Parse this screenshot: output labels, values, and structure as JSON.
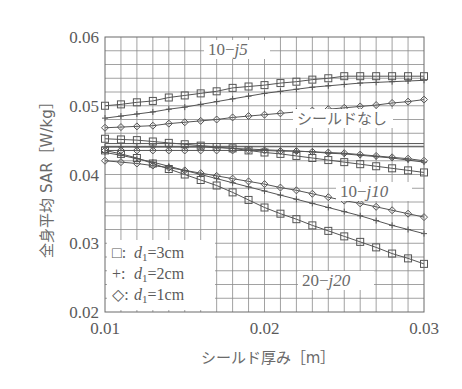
{
  "chart_data": {
    "type": "line",
    "title": "",
    "xlabel": "シールド厚み［m］",
    "ylabel": "全身平均 SAR［W/kg］",
    "xlim": [
      0.01,
      0.03
    ],
    "ylim": [
      0.02,
      0.06
    ],
    "x_ticks": [
      "0.01",
      "0.02",
      "0.03"
    ],
    "y_ticks": [
      "0.02",
      "0.03",
      "0.04",
      "0.05",
      "0.06"
    ],
    "grid": true,
    "x": [
      0.01,
      0.011,
      0.012,
      0.013,
      0.014,
      0.015,
      0.016,
      0.017,
      0.018,
      0.019,
      0.02,
      0.021,
      0.022,
      0.023,
      0.024,
      0.025,
      0.026,
      0.027,
      0.028,
      0.029,
      0.03
    ],
    "legend": [
      {
        "marker": "□",
        "label": "d1=3cm",
        "marker_name": "square"
      },
      {
        "marker": "+",
        "label": "d1=2cm",
        "marker_name": "plus"
      },
      {
        "marker": "◇",
        "label": "d1=1cm",
        "marker_name": "diamond"
      }
    ],
    "legend_position": "lower-left",
    "annotations": [
      {
        "text_main": "10",
        "text_sep": "−",
        "text_imag": "j5",
        "group": "10−j5"
      },
      {
        "text": "シールドなし",
        "group": "no-shield"
      },
      {
        "text_main": "10",
        "text_sep": "−",
        "text_imag": "j10",
        "group": "10−j10"
      },
      {
        "text_main": "20",
        "text_sep": "−",
        "text_imag": "j20",
        "group": "20−j20"
      }
    ],
    "reference_lines": [
      {
        "name": "シールドなし",
        "values": [
          0.0445,
          0.0441
        ]
      }
    ],
    "series": [
      {
        "name": "10−j5, d1=3cm",
        "marker": "square",
        "values": [
          0.05,
          0.0502,
          0.0505,
          0.0507,
          0.0512,
          0.0515,
          0.0518,
          0.0521,
          0.0526,
          0.0528,
          0.053,
          0.0533,
          0.0535,
          0.0538,
          0.054,
          0.0543,
          0.0543,
          0.0543,
          0.0543,
          0.0543,
          0.0543
        ]
      },
      {
        "name": "10−j5, d1=2cm",
        "marker": "plus",
        "values": [
          0.0482,
          0.0485,
          0.0488,
          0.0491,
          0.0495,
          0.0498,
          0.0502,
          0.0506,
          0.051,
          0.0514,
          0.0518,
          0.0521,
          0.0524,
          0.0527,
          0.0529,
          0.0531,
          0.0533,
          0.0534,
          0.0535,
          0.0536,
          0.0537
        ]
      },
      {
        "name": "10−j5, d1=1cm",
        "marker": "diamond",
        "values": [
          0.0468,
          0.0469,
          0.047,
          0.0471,
          0.0474,
          0.0476,
          0.0478,
          0.048,
          0.0483,
          0.0485,
          0.0487,
          0.0489,
          0.0491,
          0.0493,
          0.0495,
          0.0497,
          0.0499,
          0.0501,
          0.0504,
          0.0506,
          0.0509
        ]
      },
      {
        "name": "10−j10, d1=3cm",
        "marker": "square",
        "values": [
          0.0452,
          0.0451,
          0.045,
          0.0448,
          0.0446,
          0.0444,
          0.0442,
          0.044,
          0.0438,
          0.0435,
          0.0432,
          0.043,
          0.0427,
          0.0424,
          0.0421,
          0.0418,
          0.0415,
          0.0412,
          0.0409,
          0.0406,
          0.0403
        ]
      },
      {
        "name": "10−j10, d1=2cm",
        "marker": "plus",
        "values": [
          0.044,
          0.044,
          0.044,
          0.044,
          0.044,
          0.044,
          0.044,
          0.0439,
          0.0438,
          0.0437,
          0.0436,
          0.0435,
          0.0434,
          0.0433,
          0.0431,
          0.043,
          0.0428,
          0.0426,
          0.0424,
          0.0421,
          0.0418
        ]
      },
      {
        "name": "10−j10, d1=1cm",
        "marker": "diamond",
        "values": [
          0.0435,
          0.0435,
          0.0435,
          0.0435,
          0.0435,
          0.0435,
          0.0435,
          0.0435,
          0.0435,
          0.0435,
          0.0435,
          0.0434,
          0.0434,
          0.0433,
          0.0432,
          0.0431,
          0.0429,
          0.0427,
          0.0425,
          0.0423,
          0.042
        ]
      },
      {
        "name": "20−j20, d1=3cm",
        "marker": "square",
        "values": [
          0.0435,
          0.043,
          0.0424,
          0.0416,
          0.0408,
          0.04,
          0.0392,
          0.0384,
          0.0374,
          0.0363,
          0.0352,
          0.0343,
          0.0335,
          0.0326,
          0.0318,
          0.031,
          0.0302,
          0.0294,
          0.0285,
          0.0278,
          0.027
        ]
      },
      {
        "name": "20−j20, d1=2cm",
        "marker": "plus",
        "values": [
          0.0432,
          0.0428,
          0.0423,
          0.0418,
          0.0412,
          0.0406,
          0.04,
          0.0394,
          0.0388,
          0.0382,
          0.0376,
          0.037,
          0.0364,
          0.0358,
          0.0352,
          0.0346,
          0.034,
          0.0333,
          0.0326,
          0.032,
          0.0314
        ]
      },
      {
        "name": "20−j20, d1=1cm",
        "marker": "diamond",
        "values": [
          0.042,
          0.0418,
          0.0416,
          0.0413,
          0.041,
          0.0406,
          0.0402,
          0.0398,
          0.0394,
          0.039,
          0.0386,
          0.0381,
          0.0377,
          0.0372,
          0.0367,
          0.0362,
          0.0358,
          0.0353,
          0.0348,
          0.0343,
          0.0338
        ]
      }
    ]
  }
}
